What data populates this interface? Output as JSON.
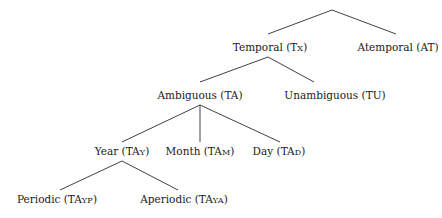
{
  "diagram": {
    "type": "tree",
    "title": "",
    "colors": {
      "edge": "#2a2a2a",
      "text": "#1a1a1a",
      "background": "#ffffff"
    },
    "root": {
      "id": "root",
      "label": "",
      "x": 332,
      "y": 10
    },
    "nodes": [
      {
        "id": "temporal",
        "name": "Temporal",
        "abbr_main": "T",
        "abbr_small": "X",
        "label": "Temporal (TX)",
        "x": 270,
        "y": 47,
        "parent": "root"
      },
      {
        "id": "atemporal",
        "name": "Atemporal",
        "abbr_main": "AT",
        "abbr_small": "",
        "label": "Atemporal (AT)",
        "x": 398,
        "y": 47,
        "parent": "root"
      },
      {
        "id": "ambiguous",
        "name": "Ambiguous",
        "abbr_main": "TA",
        "abbr_small": "",
        "label": "Ambiguous (TA)",
        "x": 200,
        "y": 95,
        "parent": "temporal"
      },
      {
        "id": "unambiguous",
        "name": "Unambiguous",
        "abbr_main": "TU",
        "abbr_small": "",
        "label": "Unambiguous (TU)",
        "x": 335,
        "y": 95,
        "parent": "temporal"
      },
      {
        "id": "year",
        "name": "Year",
        "abbr_main": "TA",
        "abbr_small": "Y",
        "label": "Year (TAY)",
        "x": 122,
        "y": 151,
        "parent": "ambiguous"
      },
      {
        "id": "month",
        "name": "Month",
        "abbr_main": "TA",
        "abbr_small": "M",
        "label": "Month (TAM)",
        "x": 200,
        "y": 151,
        "parent": "ambiguous"
      },
      {
        "id": "day",
        "name": "Day",
        "abbr_main": "TA",
        "abbr_small": "D",
        "label": "Day (TAD)",
        "x": 279,
        "y": 151,
        "parent": "ambiguous"
      },
      {
        "id": "periodic",
        "name": "Periodic",
        "abbr_main": "TA",
        "abbr_small": "YP",
        "label": "Periodic (TAYP)",
        "x": 57,
        "y": 199,
        "parent": "year"
      },
      {
        "id": "aperiodic",
        "name": "Aperiodic",
        "abbr_main": "TA",
        "abbr_small": "YA",
        "label": "Aperiodic (TAYA)",
        "x": 184,
        "y": 199,
        "parent": "year"
      }
    ],
    "edges": [
      {
        "from": "root",
        "to": "temporal",
        "x1": 332,
        "y1": 10,
        "x2": 268,
        "y2": 34
      },
      {
        "from": "root",
        "to": "atemporal",
        "x1": 332,
        "y1": 10,
        "x2": 396,
        "y2": 34
      },
      {
        "from": "temporal",
        "to": "ambiguous",
        "x1": 268,
        "y1": 57,
        "x2": 200,
        "y2": 82
      },
      {
        "from": "temporal",
        "to": "unambiguous",
        "x1": 268,
        "y1": 57,
        "x2": 314,
        "y2": 82
      },
      {
        "from": "ambiguous",
        "to": "year",
        "x1": 200,
        "y1": 105,
        "x2": 122,
        "y2": 142
      },
      {
        "from": "ambiguous",
        "to": "month",
        "x1": 200,
        "y1": 105,
        "x2": 200,
        "y2": 142
      },
      {
        "from": "ambiguous",
        "to": "day",
        "x1": 200,
        "y1": 105,
        "x2": 280,
        "y2": 142
      },
      {
        "from": "year",
        "to": "periodic",
        "x1": 122,
        "y1": 161,
        "x2": 60,
        "y2": 190
      },
      {
        "from": "year",
        "to": "aperiodic",
        "x1": 122,
        "y1": 161,
        "x2": 178,
        "y2": 190
      }
    ]
  }
}
